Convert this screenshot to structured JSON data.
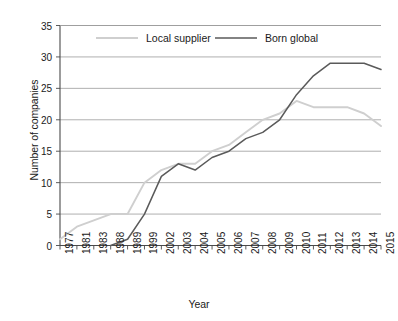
{
  "chart_data": {
    "type": "line",
    "title": "",
    "xlabel": "Year",
    "ylabel": "Number of companies",
    "categories": [
      "1977",
      "1981",
      "1983",
      "1988",
      "1989",
      "1999",
      "2002",
      "2003",
      "2004",
      "2005",
      "2006",
      "2007",
      "2008",
      "2009",
      "2010",
      "2011",
      "2012",
      "2013",
      "2014",
      "2015"
    ],
    "yticks": [
      0,
      5,
      10,
      15,
      20,
      25,
      30,
      35
    ],
    "ylim": [
      0,
      35
    ],
    "grid": true,
    "legend_position": "top-inside",
    "series": [
      {
        "name": "Local supplier",
        "color": "#cfcfcf",
        "values": [
          1,
          3,
          4,
          5,
          5,
          10,
          12,
          13,
          13,
          15,
          16,
          18,
          20,
          21,
          23,
          22,
          22,
          22,
          21,
          19
        ]
      },
      {
        "name": "Born global",
        "color": "#5a5a5a",
        "values": [
          null,
          null,
          null,
          0,
          1,
          5,
          11,
          13,
          12,
          14,
          15,
          17,
          18,
          20,
          24,
          27,
          29,
          29,
          29,
          28
        ]
      }
    ]
  },
  "legend": {
    "items": [
      {
        "label": "Local supplier"
      },
      {
        "label": "Born global"
      }
    ]
  },
  "axes": {
    "x_title": "Year",
    "y_title": "Number of companies"
  }
}
